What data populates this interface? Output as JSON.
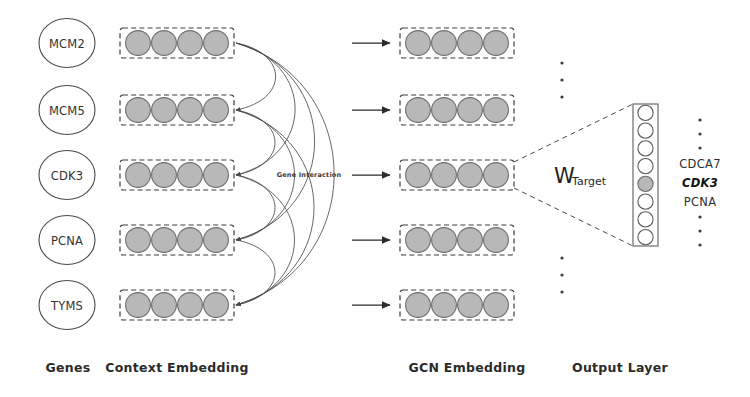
{
  "figure": {
    "background": "#ffffff"
  },
  "colors": {
    "circle_fill": "#b8b8b8",
    "circle_stroke": "#6e6e6e",
    "gene_circle_stroke": "#4a4a4a",
    "dash_box_stroke": "#3c3c3c",
    "arrow": "#2b2b2b",
    "curve": "#4b4b4b",
    "output_box_stroke": "#6b6b6b",
    "text": "#2e2e2e"
  },
  "genes": {
    "items": [
      {
        "name": "MCM2"
      },
      {
        "name": "MCM5"
      },
      {
        "name": "CDK3"
      },
      {
        "name": "PCNA"
      },
      {
        "name": "TYMS"
      }
    ],
    "context_embedding_units": 4,
    "gcn_embedding_units": 4
  },
  "edges": {
    "label": "Gene Interaction"
  },
  "weights": {
    "symbol": "W",
    "subscript": "Target"
  },
  "output_layer": {
    "node_count": 8,
    "highlighted_index": 4,
    "labels": [
      {
        "text": "·",
        "style": "dot"
      },
      {
        "text": "·",
        "style": "dot"
      },
      {
        "text": "·",
        "style": "dot"
      },
      {
        "text": "CDCA7",
        "style": "plain"
      },
      {
        "text": "CDK3",
        "style": "highlight"
      },
      {
        "text": "PCNA",
        "style": "plain"
      },
      {
        "text": "·",
        "style": "dot"
      },
      {
        "text": "·",
        "style": "dot"
      },
      {
        "text": "·",
        "style": "dot"
      }
    ]
  },
  "vertical_ellipsis": {
    "above": [
      "·",
      "·",
      "·"
    ],
    "below": [
      "·",
      "·",
      "·"
    ]
  },
  "section_labels": [
    {
      "text": "Genes"
    },
    {
      "text": "Context Embedding"
    },
    {
      "text": "GCN Embedding"
    },
    {
      "text": "Output Layer"
    }
  ]
}
